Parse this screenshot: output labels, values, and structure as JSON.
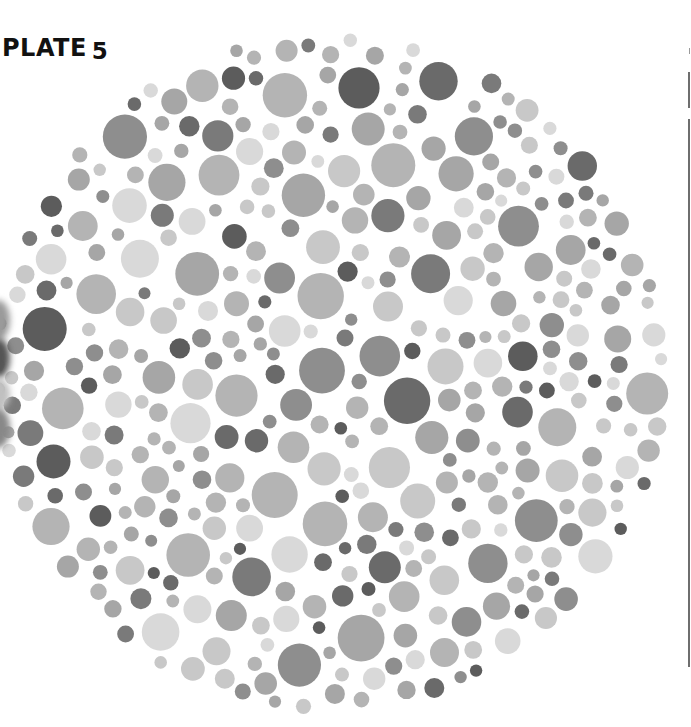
{
  "plate": {
    "label_word": "PLATE",
    "label_number": "5",
    "center_x": 330,
    "center_y": 373,
    "radius": 342,
    "seed": 5,
    "min_dot_radius": 6,
    "max_dot_radius": 24,
    "gap": 3,
    "attempts": 9000,
    "shades": [
      "#d9d9d9",
      "#c8c8c8",
      "#b4b4b4",
      "#a6a6a6",
      "#8e8e8e",
      "#7a7a7a",
      "#6a6a6a",
      "#5c5c5c"
    ],
    "shade_weights": [
      14,
      16,
      18,
      16,
      12,
      10,
      8,
      6
    ]
  },
  "left_edge_bleed": [
    {
      "top": 300,
      "height": 40,
      "color": "#9a9a9a"
    },
    {
      "top": 338,
      "height": 40,
      "color": "#555555"
    },
    {
      "top": 378,
      "height": 32,
      "color": "#c0c0c0"
    },
    {
      "top": 408,
      "height": 40,
      "color": "#888888"
    }
  ]
}
